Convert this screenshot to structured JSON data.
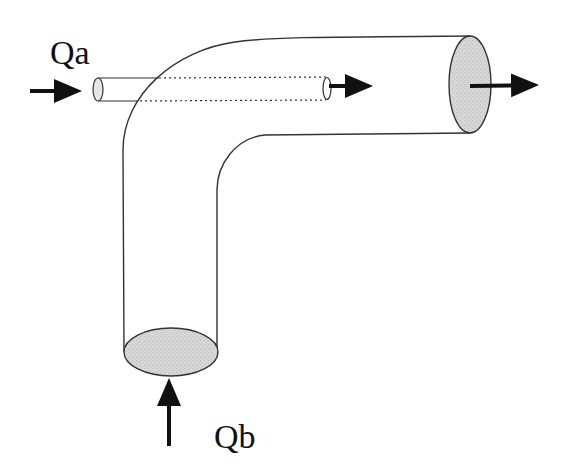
{
  "diagram": {
    "type": "pipe-junction-flow",
    "labels": {
      "inlet_a": "Qa",
      "inlet_b": "Qb"
    },
    "colors": {
      "stroke": "#333333",
      "fill_section": "#d4d4d4",
      "arrow": "#111111",
      "background": "#ffffff"
    }
  }
}
